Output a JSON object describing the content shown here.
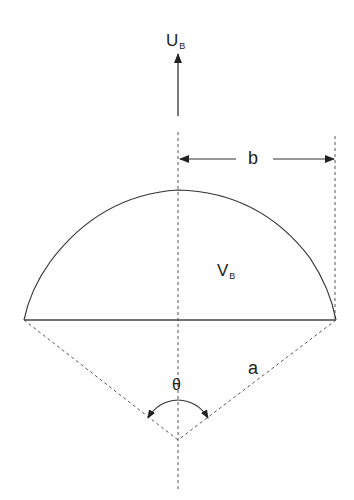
{
  "diagram": {
    "type": "spherical cap bubble geometry",
    "labels": {
      "velocity": {
        "main": "U",
        "sub": "B"
      },
      "volume": {
        "main": "V",
        "sub": "B"
      },
      "half_width": "b",
      "radius": "a",
      "angle": "θ"
    },
    "colors": {
      "stroke": "#333333",
      "dashed": "#555555",
      "text": "#222222",
      "background": "#ffffff"
    }
  }
}
